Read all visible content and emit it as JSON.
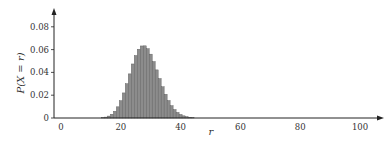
{
  "chart_data": {
    "type": "bar",
    "title": "",
    "xlabel": "r",
    "ylabel": "P(X = r)",
    "xlim": [
      0,
      100
    ],
    "ylim": [
      0,
      0.09
    ],
    "xticks": [
      0,
      20,
      40,
      60,
      80,
      100
    ],
    "yticks": [
      0,
      0.02,
      0.04,
      0.06,
      0.08
    ],
    "ytick_labels": [
      "0",
      "0.02",
      "0.04",
      "0.06",
      "0.08"
    ],
    "xtick_labels": [
      "0",
      "20",
      "40",
      "60",
      "80",
      "100"
    ],
    "grid": false,
    "bar_color": "#8c8c8c",
    "bar_edge_color": "#555555",
    "x": [
      12,
      13,
      14,
      15,
      16,
      17,
      18,
      19,
      20,
      21,
      22,
      23,
      24,
      25,
      26,
      27,
      28,
      29,
      30,
      31,
      32,
      33,
      34,
      35,
      36,
      37,
      38,
      39,
      40,
      41,
      42,
      43,
      44,
      45,
      46,
      47,
      48,
      49,
      50
    ],
    "values": [
      5e-05,
      0.00014,
      0.00035,
      0.0008,
      0.0017,
      0.0033,
      0.0059,
      0.0098,
      0.0152,
      0.022,
      0.0301,
      0.0387,
      0.0474,
      0.0548,
      0.0603,
      0.0632,
      0.0633,
      0.0608,
      0.056,
      0.0495,
      0.0422,
      0.0346,
      0.0274,
      0.0208,
      0.0153,
      0.0108,
      0.0074,
      0.0049,
      0.0031,
      0.0019,
      0.0012,
      0.0007,
      0.0004,
      0.0002,
      0.0001,
      6e-05,
      3e-05,
      1e-05,
      1e-05
    ]
  },
  "labels": {
    "ylabel": "P(X = r)",
    "xlabel": "r"
  }
}
